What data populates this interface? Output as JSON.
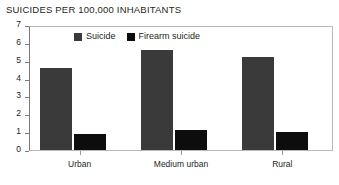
{
  "chart_data": {
    "type": "bar",
    "title": "SUICIDES PER 100,000 INHABITANTS",
    "xlabel": "",
    "ylabel": "",
    "ylim": [
      0,
      7
    ],
    "ytick_step": 1,
    "yticks": [
      "7",
      "6",
      "5",
      "4",
      "3",
      "2",
      "1",
      "0"
    ],
    "grid": false,
    "legend_position": "top-left-inside",
    "categories": [
      "Urban",
      "Medium urban",
      "Rural"
    ],
    "series": [
      {
        "name": "Suicide",
        "color": "#3a3a3a",
        "values": [
          4.6,
          5.6,
          5.2
        ]
      },
      {
        "name": "Firearm suicide",
        "color": "#0d0d0d",
        "values": [
          0.9,
          1.1,
          1.0
        ]
      }
    ]
  }
}
